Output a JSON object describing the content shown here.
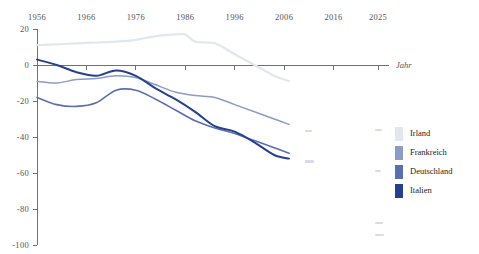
{
  "chart_data": {
    "type": "line",
    "title": "",
    "subtitle": "",
    "xlabel": "Jahr",
    "ylabel": "",
    "xlim": [
      1956,
      2025
    ],
    "ylim": [
      -100,
      20
    ],
    "grid": false,
    "legend_position": "right",
    "x_ticks": [
      "1956",
      "1966",
      "1976",
      "1986",
      "1996",
      "2006",
      "2016",
      "2025"
    ],
    "x_tick_values": [
      1956,
      1966,
      1976,
      1986,
      1996,
      2006,
      2016,
      2025
    ],
    "y_ticks": [
      "20",
      "0",
      "-20",
      "-40",
      "-60",
      "-80",
      "-100"
    ],
    "y_tick_values": [
      20,
      0,
      -20,
      -40,
      -60,
      -80,
      -100
    ],
    "series": [
      {
        "name": "Irland",
        "color": "#e2e6f0",
        "x": [
          1956,
          1960,
          1964,
          1968,
          1972,
          1976,
          1980,
          1984,
          1986,
          1988,
          1992,
          1996,
          2000,
          2004,
          2007
        ],
        "values": [
          11,
          11.5,
          12,
          12.5,
          13,
          14,
          16,
          17,
          17,
          13,
          12,
          6,
          0,
          -6,
          -9
        ]
      },
      {
        "name": "Frankreich",
        "color": "#8e9bc6",
        "x": [
          1956,
          1960,
          1964,
          1968,
          1972,
          1976,
          1980,
          1984,
          1988,
          1992,
          1996,
          2000,
          2004,
          2007
        ],
        "values": [
          -9,
          -10,
          -8,
          -7.5,
          -6,
          -7,
          -11,
          -15,
          -17,
          -18,
          -22,
          -26,
          -30,
          -33
        ]
      },
      {
        "name": "Deutschland",
        "color": "#5b6fae",
        "x": [
          1956,
          1960,
          1964,
          1968,
          1972,
          1976,
          1980,
          1984,
          1988,
          1992,
          1996,
          2000,
          2004,
          2007
        ],
        "values": [
          -18,
          -22,
          -23,
          -21,
          -14,
          -14,
          -19,
          -25,
          -31,
          -35,
          -38,
          -42,
          -46,
          -49
        ]
      },
      {
        "name": "Italien",
        "color": "#27408b",
        "x": [
          1956,
          1960,
          1964,
          1968,
          1972,
          1976,
          1980,
          1984,
          1988,
          1992,
          1996,
          2000,
          2004,
          2007
        ],
        "values": [
          3,
          0,
          -4,
          -6,
          -3,
          -6,
          -13,
          -19,
          -26,
          -34,
          -37,
          -43,
          -50,
          -52
        ]
      }
    ]
  },
  "legend": {
    "items": [
      {
        "label": "Irland",
        "color": "#e2e6f0"
      },
      {
        "label": "Frankreich",
        "color": "#8e9bc6"
      },
      {
        "label": "Deutschland",
        "color": "#5b6fae"
      },
      {
        "label": "Italien",
        "color": "#27408b"
      }
    ]
  },
  "axis": {
    "x_title": "Jahr"
  }
}
